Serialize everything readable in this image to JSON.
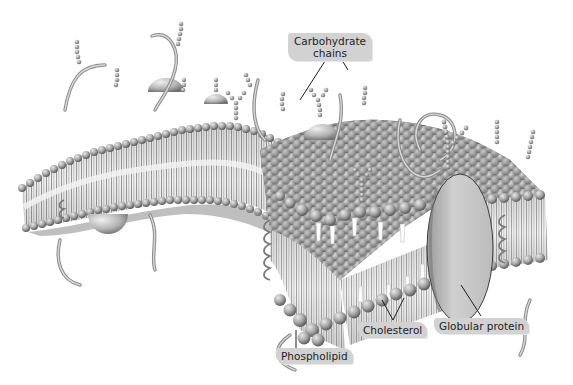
{
  "diagram": {
    "labels": {
      "carbohydrate_line1": "Carbohydrate",
      "carbohydrate_line2": "chains",
      "phospholipid": "Phospholipid",
      "cholesterol": "Cholesterol",
      "globular_protein": "Globular protein"
    },
    "colors": {
      "background": "#ffffff",
      "label_fill": "#d2d2d2",
      "head_light": "#c8c8c8",
      "head_dark": "#6e6e6e",
      "tail": "#4a4a4a",
      "core": "#eaeaea",
      "protein": "#c4c4c4"
    }
  }
}
